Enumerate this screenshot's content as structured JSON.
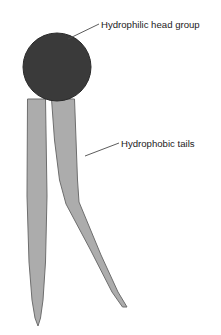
{
  "figure": {
    "background_color": "#ffffff"
  },
  "head_group": {
    "label": "Hydrophilic head group",
    "shape": "circle",
    "fill_color": "#3a3a3a",
    "stroke_color": "#2b2b2b",
    "center_x": 57,
    "center_y": 67,
    "radius": 34
  },
  "tails": {
    "label": "Hydrophobic tails",
    "fill_color": "#acacac",
    "stroke_color": "#6e6e6e",
    "count": 2,
    "left_tail": {
      "name": "straight-tail",
      "tip_x": 38,
      "tip_y": 326
    },
    "right_tail": {
      "name": "kinked-tail",
      "kink_x": 66,
      "kink_y": 205,
      "tip_x": 127,
      "tip_y": 307
    }
  },
  "annotations": [
    {
      "id": "head-annotation",
      "text": "Hydrophilic head group",
      "text_x": 101,
      "text_y": 28,
      "leader_from_x": 68,
      "leader_from_y": 39,
      "leader_to_x": 99,
      "leader_to_y": 24
    },
    {
      "id": "tails-annotation",
      "text": "Hydrophobic tails",
      "text_x": 121,
      "text_y": 147,
      "leader_from_x": 85,
      "leader_from_y": 156,
      "leader_to_x": 119,
      "leader_to_y": 143
    }
  ]
}
